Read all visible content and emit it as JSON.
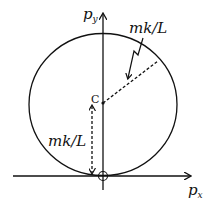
{
  "diagram": {
    "type": "momentum-space circle (hodograph)",
    "axes": {
      "x_label": "p",
      "x_sub": "x",
      "y_label": "p",
      "y_sub": "y"
    },
    "center_label": "C",
    "radius_label": "mk/L",
    "offset_label": "mk/L",
    "colors": {
      "stroke": "#111111",
      "background": "#ffffff"
    }
  }
}
